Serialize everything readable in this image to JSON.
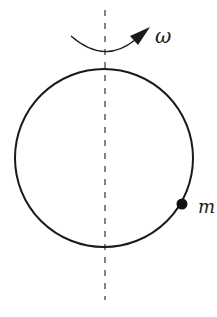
{
  "diagram": {
    "colors": {
      "stroke": "#1a1a1a",
      "background": "#ffffff"
    },
    "axis": {
      "style": "dashed",
      "x": 105,
      "y_top": 10,
      "y_bottom": 300
    },
    "hoop": {
      "cx": 104,
      "cy": 158,
      "r": 89
    },
    "rotation": {
      "label": "ω",
      "direction": "counterclockwise-viewed-from-above"
    },
    "bead": {
      "label": "m",
      "cx": 182,
      "cy": 204,
      "r": 5
    }
  }
}
